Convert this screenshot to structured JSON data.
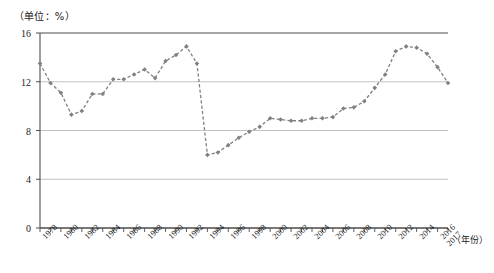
{
  "unit_label": "（单位：%）",
  "x_axis_title": "（年份）",
  "caption": "",
  "colors": {
    "series": "#808080",
    "axis": "#4d4d4d",
    "grid": "#b3b3b3"
  },
  "chart_data": {
    "type": "line",
    "title": "",
    "subtitle": "",
    "xlabel": "（年份）",
    "ylabel": "（单位：%）",
    "ylim": [
      0,
      16
    ],
    "yticks": [
      0,
      4,
      8,
      12,
      16
    ],
    "ytick_labels": [
      "0",
      "4",
      "8",
      "12",
      "16"
    ],
    "xlim": [
      1978,
      2017
    ],
    "xticks": [
      1978,
      1980,
      1982,
      1984,
      1986,
      1988,
      1990,
      1992,
      1994,
      1996,
      1998,
      2000,
      2002,
      2004,
      2006,
      2008,
      2010,
      2012,
      2014,
      2016,
      2017
    ],
    "xtick_labels": [
      "1978",
      "1980",
      "1982",
      "1984",
      "1986",
      "1988",
      "1990",
      "1992",
      "1994",
      "1996",
      "1998",
      "2000",
      "2002",
      "2004",
      "2006",
      "2008",
      "2010",
      "2012",
      "2014",
      "2016",
      "2017"
    ],
    "grid": true,
    "grid_axis": "y",
    "legend": false,
    "legend_position": "none",
    "marker": "diamond",
    "linestyle": "dashed",
    "x": [
      1978,
      1979,
      1980,
      1981,
      1982,
      1983,
      1984,
      1985,
      1986,
      1987,
      1988,
      1989,
      1990,
      1991,
      1992,
      1993,
      1994,
      1995,
      1996,
      1997,
      1998,
      1999,
      2000,
      2001,
      2002,
      2003,
      2004,
      2005,
      2006,
      2007,
      2008,
      2009,
      2010,
      2011,
      2012,
      2013,
      2014,
      2015,
      2016,
      2017
    ],
    "values": [
      13.5,
      11.9,
      11.1,
      9.3,
      9.6,
      11.0,
      11.0,
      12.2,
      12.2,
      12.6,
      13.0,
      12.3,
      13.7,
      14.2,
      14.9,
      13.5,
      6.0,
      6.2,
      6.8,
      7.4,
      7.9,
      8.3,
      9.0,
      8.9,
      8.8,
      8.8,
      9.0,
      9.0,
      9.1,
      9.8,
      9.9,
      10.4,
      11.5,
      12.6,
      14.5,
      14.9,
      14.8,
      14.3,
      13.2,
      11.9
    ]
  }
}
